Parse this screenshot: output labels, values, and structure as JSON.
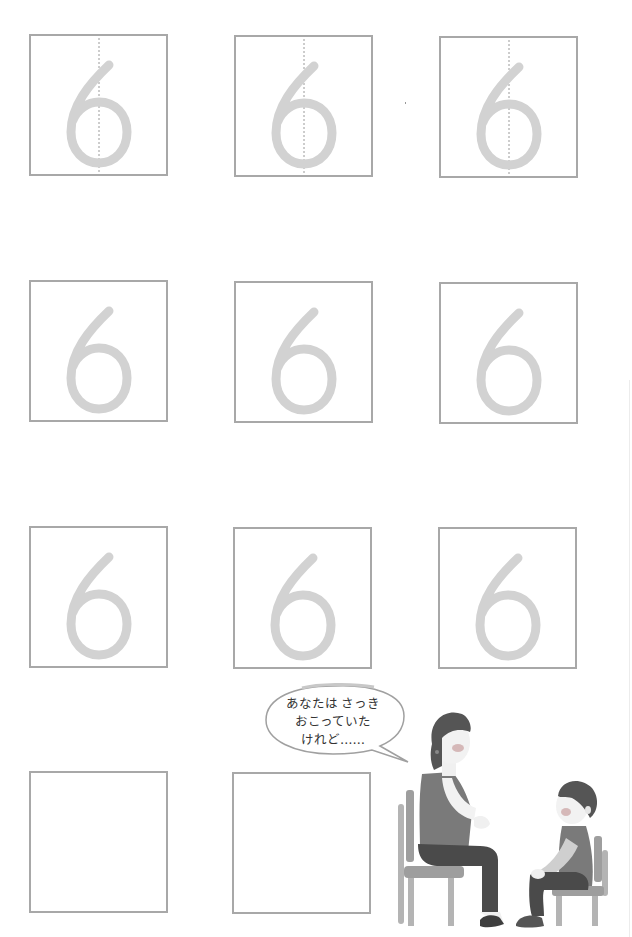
{
  "worksheet": {
    "digit": "6",
    "rows": [
      {
        "boxes": [
          {
            "glyph": "6",
            "guide": true
          },
          {
            "glyph": "6",
            "guide": true
          },
          {
            "glyph": "6",
            "guide": true
          }
        ]
      },
      {
        "boxes": [
          {
            "glyph": "6",
            "guide": false
          },
          {
            "glyph": "6",
            "guide": false
          },
          {
            "glyph": "6",
            "guide": false
          }
        ]
      },
      {
        "boxes": [
          {
            "glyph": "6",
            "guide": false
          },
          {
            "glyph": "6",
            "guide": false
          },
          {
            "glyph": "6",
            "guide": false
          }
        ]
      },
      {
        "boxes": [
          {
            "glyph": "",
            "guide": false
          },
          {
            "glyph": "",
            "guide": false
          }
        ]
      }
    ]
  },
  "speech_bubble": {
    "lines": [
      "あなたは さっき",
      "おこっていた",
      "けれど……"
    ]
  },
  "illustration": {
    "description": "woman and child sitting on chairs facing each other",
    "colors": {
      "stroke": "#a8a8a8",
      "trace": "#d2d2d2",
      "hair": "#555555",
      "vest": "#7a7a7a",
      "pants": "#4a4a4a",
      "chair": "#9e9e9e",
      "skin": "#f0f0f0",
      "cheek": "#c9a0a0"
    }
  }
}
